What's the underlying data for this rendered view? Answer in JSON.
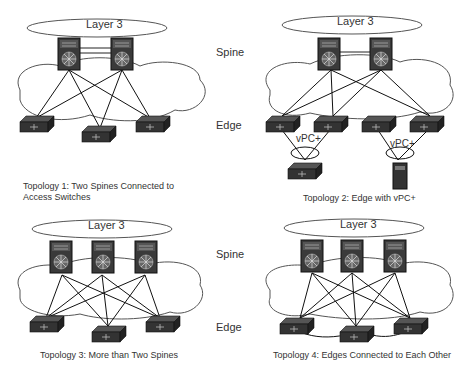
{
  "row_labels": {
    "spine": "Spine",
    "edge": "Edge",
    "spine2": "Spine",
    "edge2": "Edge"
  },
  "topologies": [
    {
      "caption_line1": "Topology 1: Two Spines Connected to",
      "caption_line2": "Access Switches",
      "cloud_label": "Layer 3"
    },
    {
      "caption_line1": "Topology 2:  Edge with vPC+",
      "cloud_label": "Layer 3",
      "vpc_label_1": "vPC+",
      "vpc_label_2": "vPC+"
    },
    {
      "caption_line1": "Topology 3: More than Two Spines",
      "cloud_label": "Layer 3"
    },
    {
      "caption_line1": "Topology 4: Edges Connected to Each Other",
      "cloud_label": "Layer 3"
    }
  ]
}
